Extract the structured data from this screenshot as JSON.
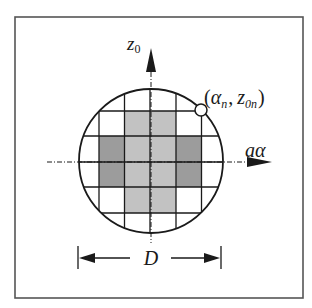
{
  "figure": {
    "frame": {
      "x": 15,
      "y": 17,
      "width": 288,
      "height": 281
    },
    "colors": {
      "line": "#1a1a1a",
      "frame": "#555555",
      "background": "#ffffff",
      "cell_light": "#c2c2c2",
      "cell_dark": "#9c9c9c"
    },
    "aperture": {
      "cx": 151,
      "cy": 161,
      "r": 72
    },
    "grid": {
      "vertical_lines": [
        73.5,
        99,
        124.5,
        150,
        176,
        201.5,
        227
      ],
      "horizontal_lines": [
        85,
        111,
        136,
        162,
        187,
        213,
        238
      ]
    },
    "axes": {
      "vertical": {
        "label_main": "z",
        "label_sub": "0",
        "x": 151,
        "arrow_tip_y": 48,
        "arrow_base_y": 72,
        "dash_bottom_y": 243
      },
      "horizontal": {
        "label": "aα",
        "y": 162,
        "dash_left_x": 47,
        "arrow_base_x": 247,
        "arrow_tip_x": 272
      }
    },
    "sample_point": {
      "cx": 201,
      "cy": 110,
      "r": 6,
      "label_open": "(",
      "label_alpha": "α",
      "label_alpha_sub": "n",
      "label_sep": ",",
      "label_z": "z",
      "label_z_sub": "0n",
      "label_close": ")"
    },
    "dimension": {
      "label": "D",
      "left_x": 78,
      "right_x": 221,
      "y": 258
    },
    "shaded_cells": {
      "light": [
        {
          "x": 124.5,
          "y": 111,
          "w": 51.5,
          "h": 102
        }
      ],
      "dark": [
        {
          "x": 99,
          "y": 136,
          "w": 25.5,
          "h": 51
        },
        {
          "x": 176,
          "y": 136,
          "w": 25.5,
          "h": 51
        }
      ]
    }
  }
}
